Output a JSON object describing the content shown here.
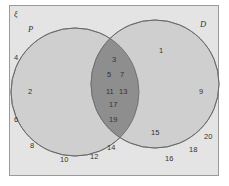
{
  "diagram": {
    "type": "venn",
    "universal_symbol": "ξ",
    "colors": {
      "frame_fill": "#e4e4e4",
      "frame_stroke": "#9a9a9a",
      "circle_fill": "#cfcfcf",
      "circle_stroke": "#777777",
      "intersection_fill": "#8e8e8e",
      "text": "#333333"
    },
    "sets": [
      {
        "name": "P",
        "label": "P",
        "only": [
          "2"
        ]
      },
      {
        "name": "D",
        "label": "D",
        "only": [
          "1",
          "9",
          "15"
        ]
      }
    ],
    "intersection": [
      "3",
      "5",
      "7",
      "11",
      "13",
      "17",
      "19"
    ],
    "outside": [
      "4",
      "6",
      "8",
      "10",
      "12",
      "14",
      "16",
      "18",
      "20"
    ],
    "labels": {
      "universal": "ξ",
      "P": "P",
      "D": "D",
      "n1": "1",
      "n2": "2",
      "n3": "3",
      "n4": "4",
      "n5": "5",
      "n6": "6",
      "n7": "7",
      "n8": "8",
      "n9": "9",
      "n10": "10",
      "n11": "11",
      "n12": "12",
      "n13": "13",
      "n14": "14",
      "n15": "15",
      "n16": "16",
      "n17": "17",
      "n18": "18",
      "n19": "19",
      "n20": "20"
    }
  }
}
